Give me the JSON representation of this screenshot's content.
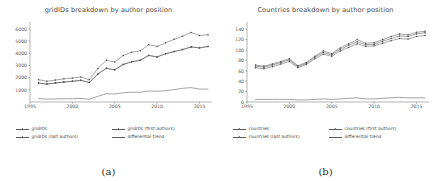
{
  "figure": {
    "panels": [
      {
        "subcaption": "(a)",
        "chart_data": {
          "type": "line",
          "title": "gridIDs breakdown by author position",
          "xlabel": "",
          "ylabel": "",
          "xlim": [
            1995,
            2016
          ],
          "ylim": [
            0,
            6400
          ],
          "xticks": [
            1995,
            2000,
            2005,
            2010,
            2015
          ],
          "xticklabels": [
            "1995",
            "2000",
            "2005",
            "2010",
            "2015"
          ],
          "yticks": [
            1000,
            2000,
            3000,
            4000,
            5000,
            6000
          ],
          "yticklabels": [
            "1000",
            "2000",
            "3000",
            "4000",
            "5000",
            "6000"
          ],
          "grid": false,
          "legend_position": "below",
          "x": [
            1996,
            1997,
            1998,
            1999,
            2000,
            2001,
            2002,
            2003,
            2004,
            2005,
            2006,
            2007,
            2008,
            2009,
            2010,
            2011,
            2012,
            2013,
            2014,
            2015,
            2016
          ],
          "series": [
            {
              "name": "gridIDs",
              "marker": "dot",
              "values": [
                1830,
                1700,
                1800,
                1900,
                1960,
                2060,
                1820,
                2750,
                3420,
                3280,
                3820,
                4080,
                4200,
                4700,
                4560,
                4860,
                5140,
                5400,
                5700,
                5460,
                5520
              ]
            },
            {
              "name": "gridIDs (first authors)",
              "marker": "dot",
              "values": [
                1560,
                1470,
                1560,
                1640,
                1700,
                1780,
                1600,
                2300,
                2760,
                2640,
                3080,
                3300,
                3420,
                3820,
                3700,
                3960,
                4140,
                4300,
                4520,
                4440,
                4560
              ]
            },
            {
              "name": "gridIDs (last authors)",
              "marker": "dot",
              "values": [
                1560,
                1470,
                1560,
                1640,
                1700,
                1780,
                1600,
                2300,
                2760,
                2640,
                3080,
                3300,
                3420,
                3820,
                3700,
                3960,
                4140,
                4300,
                4520,
                4440,
                4560
              ]
            },
            {
              "name": "differential trend",
              "marker": "none",
              "values": [
                270,
                240,
                250,
                265,
                275,
                290,
                230,
                460,
                680,
                660,
                760,
                800,
                800,
                900,
                880,
                920,
                1020,
                1120,
                1180,
                1060,
                1060
              ]
            }
          ]
        }
      },
      {
        "subcaption": "(b)",
        "chart_data": {
          "type": "line",
          "title": "Countries breakdown by author position",
          "xlabel": "",
          "ylabel": "",
          "xlim": [
            1995,
            2016
          ],
          "ylim": [
            0,
            150
          ],
          "xticks": [
            1995,
            2000,
            2005,
            2010,
            2015
          ],
          "xticklabels": [
            "1995",
            "2000",
            "2005",
            "2010",
            "2015"
          ],
          "yticks": [
            0,
            20,
            40,
            60,
            80,
            100,
            120,
            140
          ],
          "yticklabels": [
            "0",
            "20",
            "40",
            "60",
            "80",
            "100",
            "120",
            "140"
          ],
          "grid": false,
          "legend_position": "below",
          "x": [
            1996,
            1997,
            1998,
            1999,
            2000,
            2001,
            2002,
            2003,
            2004,
            2005,
            2006,
            2007,
            2008,
            2009,
            2010,
            2011,
            2012,
            2013,
            2014,
            2015,
            2016
          ],
          "series": [
            {
              "name": "countries",
              "marker": "dot",
              "values": [
                71,
                69,
                73,
                78,
                83,
                70,
                76,
                88,
                98,
                93,
                104,
                112,
                120,
                113,
                114,
                120,
                126,
                131,
                129,
                134,
                136
              ]
            },
            {
              "name": "countries (first authors)",
              "marker": "dot",
              "values": [
                69,
                67,
                71,
                76,
                81,
                68,
                74,
                86,
                95,
                91,
                101,
                109,
                116,
                110,
                111,
                117,
                122,
                127,
                126,
                131,
                133
              ]
            },
            {
              "name": "countries (last authors)",
              "marker": "dot",
              "values": [
                66,
                64,
                68,
                73,
                78,
                66,
                72,
                83,
                92,
                88,
                98,
                105,
                112,
                107,
                108,
                113,
                118,
                122,
                121,
                126,
                128
              ]
            },
            {
              "name": "differential trend",
              "marker": "none",
              "values": [
                5,
                5,
                5,
                5,
                5,
                4,
                4,
                5,
                6,
                5,
                6,
                7,
                8,
                6,
                6,
                7,
                8,
                9,
                8,
                8,
                8
              ]
            }
          ]
        }
      }
    ]
  }
}
